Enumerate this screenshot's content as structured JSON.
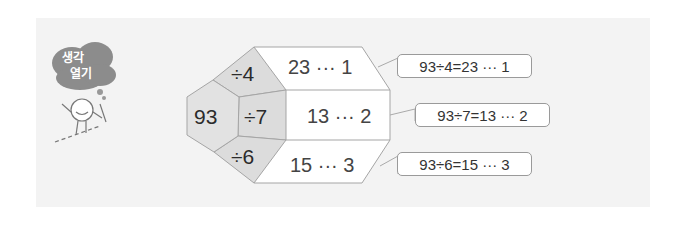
{
  "badge": {
    "line1": "생각",
    "line2": "열기"
  },
  "diagram": {
    "dividend": "93",
    "rows": [
      {
        "divisor": "÷4",
        "result": "23 ··· 1",
        "equation": "93÷4=23 ··· 1"
      },
      {
        "divisor": "÷7",
        "result": "13 ··· 2",
        "equation": "93÷7=13 ··· 2"
      },
      {
        "divisor": "÷6",
        "result": "15 ··· 3",
        "equation": "93÷6=15 ··· 3"
      }
    ]
  },
  "colors": {
    "panel": "#f3f3f3",
    "gray_cell": "#dcdcdc",
    "border": "#9a9a9a",
    "cloud": "#8c8c8c"
  }
}
